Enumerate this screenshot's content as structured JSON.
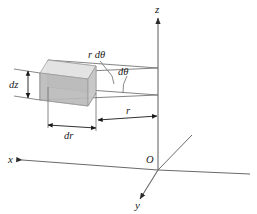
{
  "figure": {
    "background_color": "#ffffff",
    "line_color": "#555555",
    "label_color": "#1a1a1a"
  },
  "axes": {
    "x_label": "x",
    "y_label": "y",
    "z_label": "z",
    "origin_label": "O"
  },
  "dimensions": {
    "arc_length_label": "r dθ",
    "angle_label": "dθ",
    "height_label": "dz",
    "radial_thickness_label": "dr",
    "radius_label": "r"
  },
  "volume_element": {
    "fill_color": "#c9c9c9",
    "top_face_color": "#e2e2e2",
    "front_face_color": "#b6b6b6",
    "side_face_color": "#d4d4d4",
    "edge_color": "#8a8a8a"
  }
}
